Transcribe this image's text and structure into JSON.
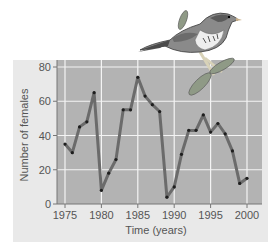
{
  "chart_data": {
    "type": "line",
    "title": "",
    "xlabel": "Time (years)",
    "ylabel": "Number of females",
    "xlim": [
      1974,
      2001
    ],
    "ylim": [
      0,
      80
    ],
    "xticks": [
      1975,
      1980,
      1985,
      1990,
      1995,
      2000
    ],
    "yticks": [
      0,
      20,
      40,
      60,
      80
    ],
    "grid": true,
    "legend": null,
    "x": [
      1975,
      1976,
      1977,
      1978,
      1979,
      1980,
      1981,
      1982,
      1983,
      1984,
      1985,
      1986,
      1987,
      1988,
      1989,
      1990,
      1991,
      1992,
      1993,
      1994,
      1995,
      1996,
      1997,
      1998,
      1999,
      2000
    ],
    "series": [
      {
        "name": "Number of females",
        "values": [
          35,
          30,
          45,
          48,
          65,
          8,
          18,
          26,
          55,
          55,
          74,
          63,
          58,
          54,
          4,
          10,
          29,
          43,
          43,
          52,
          42,
          47,
          41,
          31,
          12,
          15
        ]
      }
    ],
    "annotations": [
      "illustration of a song sparrow perched on a leafy twig"
    ]
  },
  "colors": {
    "panel_bg": "#e9e9e9",
    "plot_bg": "#b3b3b3",
    "grid": "#f4f4f4",
    "line": "#6b6b6b",
    "marker": "#1e1e1e",
    "text": "#555555"
  }
}
